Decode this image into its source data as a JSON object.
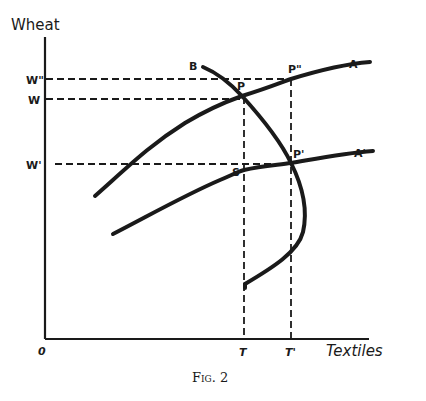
{
  "diagram": {
    "type": "economics-indifference-diagram",
    "axes": {
      "y_label": "Wheat",
      "x_label": "Textiles",
      "origin_label": "0"
    },
    "y_ticks": [
      {
        "label": "W\"",
        "y": 79
      },
      {
        "label": "W",
        "y": 99
      },
      {
        "label": "W'",
        "y": 164
      }
    ],
    "x_ticks": [
      {
        "label": "T",
        "x": 244
      },
      {
        "label": "T'",
        "x": 291
      }
    ],
    "curves": [
      {
        "label": "A",
        "description": "upper curve"
      },
      {
        "label": "A'",
        "description": "lower curve"
      },
      {
        "label": "B",
        "description": "backward-bending curve"
      }
    ],
    "points": [
      {
        "label": "P",
        "x": 242,
        "y": 96
      },
      {
        "label": "P\"",
        "x": 291,
        "y": 79
      },
      {
        "label": "P'",
        "x": 291,
        "y": 163
      },
      {
        "label": "S",
        "x": 244,
        "y": 170
      }
    ],
    "caption": "Fig. 2"
  }
}
